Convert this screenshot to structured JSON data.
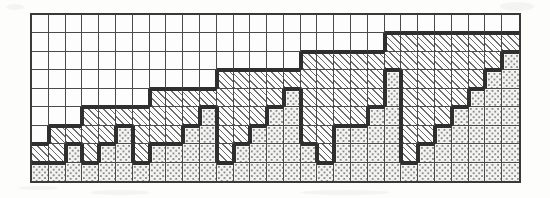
{
  "chart_data": {
    "type": "bar",
    "title": "",
    "subtitle": "",
    "xlabel": "",
    "ylabel": "",
    "grid": {
      "columns": 29,
      "rows": 9,
      "cell_px": 17
    },
    "legend": [
      {
        "key": "dot",
        "label": "dotted",
        "fill": "#f3f3f1"
      },
      {
        "key": "hatch",
        "label": "hatched",
        "fill": "#fcfcfc"
      },
      {
        "key": "empty",
        "label": "blank",
        "fill": "#fdfdfd"
      }
    ],
    "categories": [
      1,
      2,
      3,
      4,
      5,
      6,
      7,
      8,
      9,
      10,
      11,
      12,
      13,
      14,
      15,
      16,
      17,
      18,
      19,
      20,
      21,
      22,
      23,
      24,
      25,
      26,
      27,
      28,
      29
    ],
    "series": [
      {
        "name": "dotted",
        "values": [
          1,
          1,
          2,
          1,
          2,
          2,
          1,
          2,
          2,
          2,
          2,
          3,
          2,
          2,
          3,
          2,
          3,
          3,
          2,
          3,
          4,
          3,
          2,
          3,
          4,
          4,
          5,
          5,
          5
        ]
      },
      {
        "name": "hatched",
        "values": [
          1,
          2,
          1,
          3,
          2,
          2,
          4,
          3,
          3,
          3,
          4,
          3,
          5,
          5,
          4,
          6,
          5,
          5,
          6,
          5,
          4,
          6,
          7,
          6,
          5,
          5,
          4,
          3,
          2
        ]
      }
    ],
    "totals": [
      2,
      3,
      3,
      4,
      4,
      4,
      5,
      5,
      5,
      5,
      6,
      6,
      7,
      7,
      7,
      8,
      8,
      8,
      8,
      8,
      8,
      9,
      9,
      9,
      9,
      9,
      9,
      8,
      7
    ],
    "ylim": [
      0,
      9
    ],
    "grid_on": true,
    "legend_position": "none",
    "cells": [
      [
        "e",
        "e",
        "e",
        "e",
        "e",
        "e",
        "e",
        "e",
        "e",
        "e",
        "e",
        "e",
        "e",
        "e",
        "e",
        "e",
        "e",
        "e",
        "e",
        "e",
        "e",
        "e",
        "e",
        "e",
        "e",
        "e",
        "e",
        "e",
        "e"
      ],
      [
        "e",
        "e",
        "e",
        "e",
        "e",
        "e",
        "e",
        "e",
        "e",
        "e",
        "e",
        "e",
        "e",
        "e",
        "e",
        "e",
        "e",
        "e",
        "e",
        "e",
        "e",
        "h",
        "h",
        "h",
        "h",
        "h",
        "h",
        "h",
        "h"
      ],
      [
        "e",
        "e",
        "e",
        "e",
        "e",
        "e",
        "e",
        "e",
        "e",
        "e",
        "e",
        "e",
        "e",
        "e",
        "e",
        "e",
        "h",
        "h",
        "h",
        "h",
        "h",
        "h",
        "h",
        "h",
        "h",
        "h",
        "h",
        "h",
        "d"
      ],
      [
        "e",
        "e",
        "e",
        "e",
        "e",
        "e",
        "e",
        "e",
        "e",
        "e",
        "e",
        "h",
        "h",
        "h",
        "h",
        "h",
        "h",
        "h",
        "h",
        "h",
        "h",
        "d",
        "h",
        "h",
        "h",
        "h",
        "h",
        "d",
        "d"
      ],
      [
        "e",
        "e",
        "e",
        "e",
        "e",
        "e",
        "e",
        "h",
        "h",
        "h",
        "h",
        "h",
        "h",
        "h",
        "h",
        "d",
        "h",
        "h",
        "h",
        "h",
        "h",
        "d",
        "h",
        "h",
        "h",
        "h",
        "d",
        "d",
        "d"
      ],
      [
        "e",
        "e",
        "e",
        "h",
        "h",
        "h",
        "h",
        "h",
        "h",
        "h",
        "d",
        "h",
        "h",
        "h",
        "d",
        "d",
        "h",
        "h",
        "h",
        "h",
        "d",
        "d",
        "h",
        "h",
        "h",
        "d",
        "d",
        "d",
        "d"
      ],
      [
        "e",
        "h",
        "h",
        "h",
        "h",
        "d",
        "h",
        "h",
        "h",
        "d",
        "d",
        "h",
        "h",
        "d",
        "d",
        "d",
        "h",
        "h",
        "d",
        "d",
        "d",
        "d",
        "h",
        "h",
        "d",
        "d",
        "d",
        "d",
        "d"
      ],
      [
        "h",
        "h",
        "d",
        "h",
        "d",
        "d",
        "h",
        "d",
        "d",
        "d",
        "d",
        "h",
        "d",
        "d",
        "d",
        "d",
        "d",
        "h",
        "d",
        "d",
        "d",
        "d",
        "h",
        "d",
        "d",
        "d",
        "d",
        "d",
        "d"
      ],
      [
        "d",
        "d",
        "d",
        "d",
        "d",
        "d",
        "d",
        "d",
        "d",
        "d",
        "d",
        "d",
        "d",
        "d",
        "d",
        "d",
        "d",
        "d",
        "d",
        "d",
        "d",
        "d",
        "d",
        "d",
        "d",
        "d",
        "d",
        "d",
        "d"
      ]
    ],
    "cell_legend": {
      "e": "empty",
      "h": "hatched",
      "d": "dotted"
    }
  }
}
